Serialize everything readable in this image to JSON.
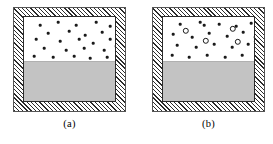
{
  "figure": {
    "title": "",
    "background_color": "#ffffff",
    "width": 273,
    "height": 144
  },
  "colors": {
    "wall_hatch_line": "#2b2b2b",
    "wall_hatch_background": "#ffffff",
    "cavity_border": "#2b2b2b",
    "vapor_fill": "#ffffff",
    "liquid_fill": "#c3c3c3",
    "particle_fill": "#1a1a1a",
    "ring_stroke": "#1a1a1a",
    "caption_text": "#000000"
  },
  "panels": [
    {
      "id": "a",
      "caption": "(a)",
      "vessel": {
        "wall_style": "hatched",
        "cavity_fill_top": "vapor",
        "cavity_fill_bottom": "liquid",
        "liquid_level_fraction": 0.5
      },
      "particles": {
        "small_dots": [
          {
            "x": 16,
            "y": 8
          },
          {
            "x": 34,
            "y": 5
          },
          {
            "x": 52,
            "y": 8
          },
          {
            "x": 72,
            "y": 5
          },
          {
            "x": 86,
            "y": 9
          },
          {
            "x": 24,
            "y": 16
          },
          {
            "x": 45,
            "y": 14
          },
          {
            "x": 61,
            "y": 18
          },
          {
            "x": 78,
            "y": 15
          },
          {
            "x": 12,
            "y": 22
          },
          {
            "x": 36,
            "y": 24
          },
          {
            "x": 55,
            "y": 22
          },
          {
            "x": 69,
            "y": 26
          },
          {
            "x": 86,
            "y": 22
          },
          {
            "x": 20,
            "y": 31
          },
          {
            "x": 42,
            "y": 33
          },
          {
            "x": 60,
            "y": 31
          },
          {
            "x": 80,
            "y": 33
          },
          {
            "x": 92,
            "y": 29
          },
          {
            "x": 10,
            "y": 39
          },
          {
            "x": 29,
            "y": 40
          },
          {
            "x": 50,
            "y": 39
          },
          {
            "x": 66,
            "y": 41
          },
          {
            "x": 83,
            "y": 40
          },
          {
            "x": 93,
            "y": 38
          }
        ],
        "open_circles": []
      }
    },
    {
      "id": "b",
      "caption": "(b)",
      "vessel": {
        "wall_style": "hatched",
        "cavity_fill_top": "vapor",
        "cavity_fill_bottom": "liquid",
        "liquid_level_fraction": 0.5
      },
      "particles": {
        "small_dots": [
          {
            "x": 17,
            "y": 7
          },
          {
            "x": 37,
            "y": 5
          },
          {
            "x": 41,
            "y": 8
          },
          {
            "x": 56,
            "y": 7
          },
          {
            "x": 73,
            "y": 9
          },
          {
            "x": 88,
            "y": 6
          },
          {
            "x": 10,
            "y": 17
          },
          {
            "x": 29,
            "y": 20
          },
          {
            "x": 46,
            "y": 16
          },
          {
            "x": 64,
            "y": 19
          },
          {
            "x": 80,
            "y": 15
          },
          {
            "x": 92,
            "y": 20
          },
          {
            "x": 14,
            "y": 28
          },
          {
            "x": 33,
            "y": 30
          },
          {
            "x": 51,
            "y": 27
          },
          {
            "x": 69,
            "y": 30
          },
          {
            "x": 85,
            "y": 27
          },
          {
            "x": 9,
            "y": 38
          },
          {
            "x": 26,
            "y": 40
          },
          {
            "x": 44,
            "y": 38
          },
          {
            "x": 62,
            "y": 40
          },
          {
            "x": 79,
            "y": 38
          },
          {
            "x": 93,
            "y": 36
          }
        ],
        "open_circles": [
          {
            "x": 23,
            "y": 14
          },
          {
            "x": 70,
            "y": 12
          },
          {
            "x": 43,
            "y": 24
          },
          {
            "x": 75,
            "y": 25
          },
          {
            "x": 94,
            "y": 25
          }
        ]
      }
    }
  ]
}
